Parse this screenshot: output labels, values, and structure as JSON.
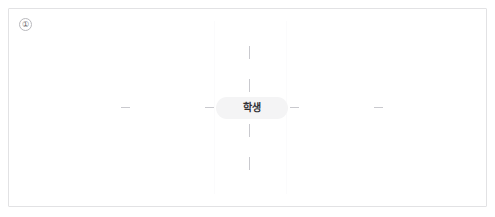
{
  "canvas": {
    "background_color": "#ffffff",
    "border_color": "#e2e2e4"
  },
  "step_badge": {
    "label": "①",
    "name": "step-one-marker"
  },
  "mindmap": {
    "root_node": {
      "label": "학생",
      "fill_color": "#f4f4f5",
      "text_color": "#2f2f33",
      "shape": "pill"
    },
    "connector_color": "#c9c9ce",
    "connectors": [
      {
        "id": "inner-left",
        "direction": "left",
        "order": "inner"
      },
      {
        "id": "inner-right",
        "direction": "right",
        "order": "inner"
      },
      {
        "id": "outer-left",
        "direction": "left",
        "order": "outer"
      },
      {
        "id": "outer-right",
        "direction": "right",
        "order": "outer"
      },
      {
        "id": "inner-top",
        "direction": "up",
        "order": "inner"
      },
      {
        "id": "inner-bottom",
        "direction": "down",
        "order": "inner"
      },
      {
        "id": "outer-top",
        "direction": "up",
        "order": "outer"
      },
      {
        "id": "outer-bottom",
        "direction": "down",
        "order": "outer"
      }
    ]
  }
}
